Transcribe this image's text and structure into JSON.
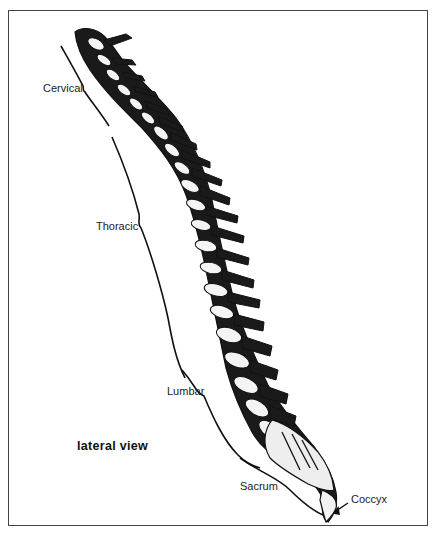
{
  "diagram": {
    "view_label": "lateral view",
    "regions": [
      {
        "id": "cervical",
        "label": "Cervical"
      },
      {
        "id": "thoracic",
        "label": "Thoracic"
      },
      {
        "id": "lumbar",
        "label": "Lumbar"
      },
      {
        "id": "sacrum",
        "label": "Sacrum"
      },
      {
        "id": "coccyx",
        "label": "Coccyx"
      }
    ],
    "colors": {
      "ink": "#111111",
      "frame": "#444444",
      "background": "#ffffff"
    }
  }
}
